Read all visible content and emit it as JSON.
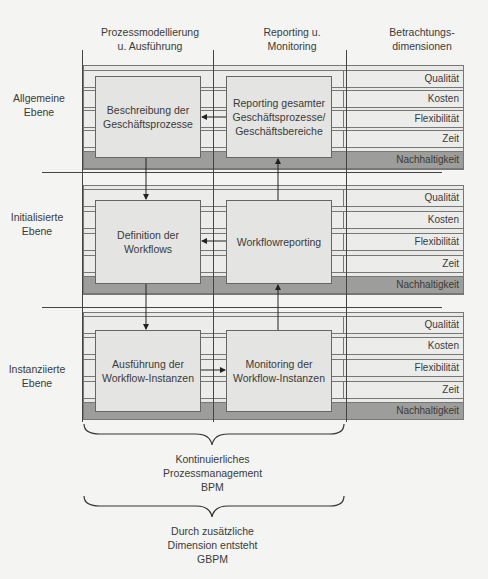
{
  "columns": [
    {
      "label": "Prozessmodellierung\nu. Ausführung"
    },
    {
      "label": "Reporting u.\nMonitoring"
    },
    {
      "label": "Betrachtungs-\ndimensionen"
    }
  ],
  "layers": [
    {
      "label": "Allgemeine\nEbene",
      "process_box": "Beschreibung der\nGeschäftsprozesse",
      "reporting_box": "Reporting gesamter\nGeschäftsprozesse/\nGeschäftsbereiche",
      "dimensions": [
        "Qualität",
        "Kosten",
        "Flexibilität",
        "Zeit",
        "Nachhaltigkeit"
      ]
    },
    {
      "label": "Initialisierte\nEbene",
      "process_box": "Definition der\nWorkflows",
      "reporting_box": "Workflowreporting",
      "dimensions": [
        "Qualität",
        "Kosten",
        "Flexibilität",
        "Zeit",
        "Nachhaltigkeit"
      ]
    },
    {
      "label": "Instanziierte\nEbene",
      "process_box": "Ausführung der\nWorkflow-Instanzen",
      "reporting_box": "Monitoring der\nWorkflow-Instanzen",
      "dimensions": [
        "Qualität",
        "Kosten",
        "Flexibilität",
        "Zeit",
        "Nachhaltigkeit"
      ]
    }
  ],
  "braces": [
    {
      "label": "Kontinuierliches\nProzessmanagement\nBPM"
    },
    {
      "label": "Durch zusätzliche\nDimension entsteht\nGBPM"
    }
  ],
  "colors": {
    "layer_bg": "#e9e9e7",
    "box_bg": "#e4e4e2",
    "sustainability_bg": "#9d9d9b",
    "line": "#444444"
  }
}
